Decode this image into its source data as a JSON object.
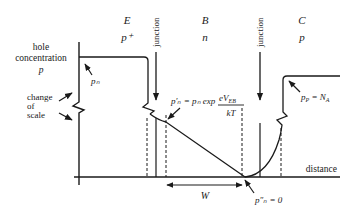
{
  "regions": [
    {
      "name": "E",
      "doping": "p⁺"
    },
    {
      "name": "B",
      "doping": "n"
    },
    {
      "name": "C",
      "doping": "p"
    }
  ],
  "axis": {
    "y_label_lines": [
      "hole",
      "concentration",
      "p"
    ],
    "x_label": "distance",
    "scale_note_lines": [
      "change",
      "of",
      "scale"
    ]
  },
  "junction_label": "junction",
  "annotations": {
    "emitter_level": "pₙ",
    "base_edge_lhs": "p′ₙ = pₙ exp",
    "base_edge_num": "eV",
    "base_edge_num_sub": "EB",
    "base_edge_den": "kT",
    "collector_level": "p",
    "collector_level_sub": "P",
    "collector_level_rhs": " = N",
    "collector_level_rhs_sub": "A",
    "collector_edge": "p″ₙ = 0",
    "width": "W"
  }
}
